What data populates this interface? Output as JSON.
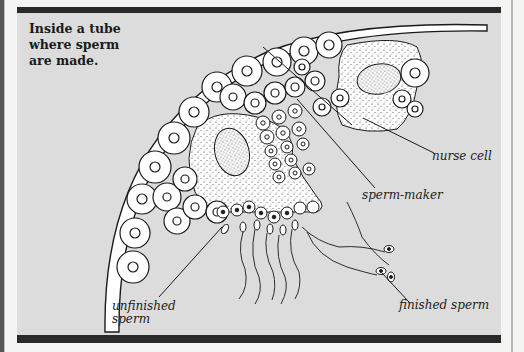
{
  "figure": {
    "title": "Inside a tube where sperm are made.",
    "title_lines": [
      "Inside a tube",
      "where sperm",
      "are made."
    ],
    "labels": {
      "nurse_cell": "nurse cell",
      "sperm_maker": "sperm-maker",
      "unfinished_sperm_line1": "unfinished",
      "unfinished_sperm_line2": "sperm",
      "finished_sperm": "finished sperm"
    },
    "colors": {
      "panel_background": "#dcdcdc",
      "frame_bars": "#2a2a2a",
      "cell_fill": "#ffffff",
      "ink": "#1a1a1a"
    }
  }
}
